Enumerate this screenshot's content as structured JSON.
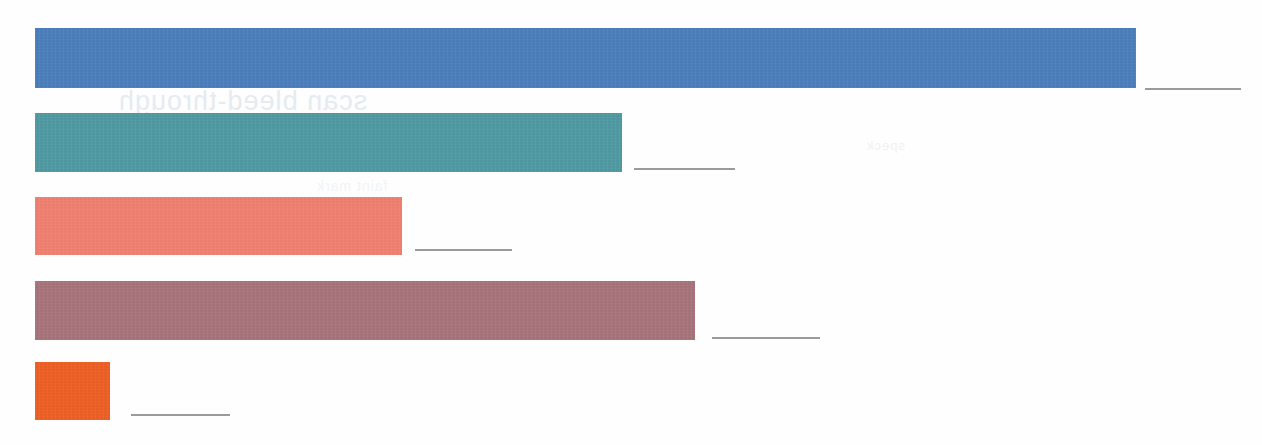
{
  "chart_data": {
    "type": "bar",
    "orientation": "horizontal",
    "title": "",
    "subtitle": "",
    "xlabel": "",
    "ylabel": "",
    "grid": false,
    "legend": false,
    "legend_position": "none",
    "axis_visible": false,
    "xlim": [
      0,
      1100
    ],
    "categories": [
      "",
      "",
      "",
      "",
      ""
    ],
    "values": [
      1101,
      587,
      367,
      660,
      75
    ],
    "value_labels": [
      "",
      "",
      "",
      "",
      ""
    ],
    "colors": [
      "#4a7ebb",
      "#4f9aa3",
      "#f08070",
      "#a8737a",
      "#ee5f24"
    ],
    "series": [
      {
        "name": "",
        "values": [
          1101,
          587,
          367,
          660,
          75
        ]
      }
    ],
    "bars": [
      {
        "name": "bar-1",
        "color": "#4a7ebb",
        "value": 1101,
        "label": "",
        "x": 35,
        "y": 28,
        "width": 1101,
        "height": 60,
        "rule_x": 1145,
        "rule_y": 88,
        "rule_width": 96
      },
      {
        "name": "bar-2",
        "color": "#4f9aa3",
        "value": 587,
        "label": "",
        "x": 35,
        "y": 113,
        "width": 587,
        "height": 59,
        "rule_x": 634,
        "rule_y": 168,
        "rule_width": 101
      },
      {
        "name": "bar-3",
        "color": "#f08070",
        "value": 367,
        "label": "",
        "x": 35,
        "y": 197,
        "width": 367,
        "height": 58,
        "rule_x": 415,
        "rule_y": 249,
        "rule_width": 97
      },
      {
        "name": "bar-4",
        "color": "#a8737a",
        "value": 660,
        "label": "",
        "x": 35,
        "y": 281,
        "width": 660,
        "height": 59,
        "rule_x": 712,
        "rule_y": 337,
        "rule_width": 108
      },
      {
        "name": "bar-5",
        "color": "#ee5f24",
        "value": 75,
        "label": "",
        "x": 35,
        "y": 362,
        "width": 75,
        "height": 58,
        "rule_x": 131,
        "rule_y": 414,
        "rule_width": 99
      }
    ],
    "background_color": "#fefefe",
    "rule_color": "#8a8a8a"
  },
  "artifacts": {
    "bleed_through": [
      {
        "text": "scan bleed-through",
        "name": "bleed-artifact-1"
      },
      {
        "text": "reverse page text",
        "name": "bleed-artifact-2"
      },
      {
        "text": "faint mark",
        "name": "bleed-artifact-3"
      },
      {
        "text": "speck",
        "name": "bleed-artifact-4"
      }
    ]
  }
}
